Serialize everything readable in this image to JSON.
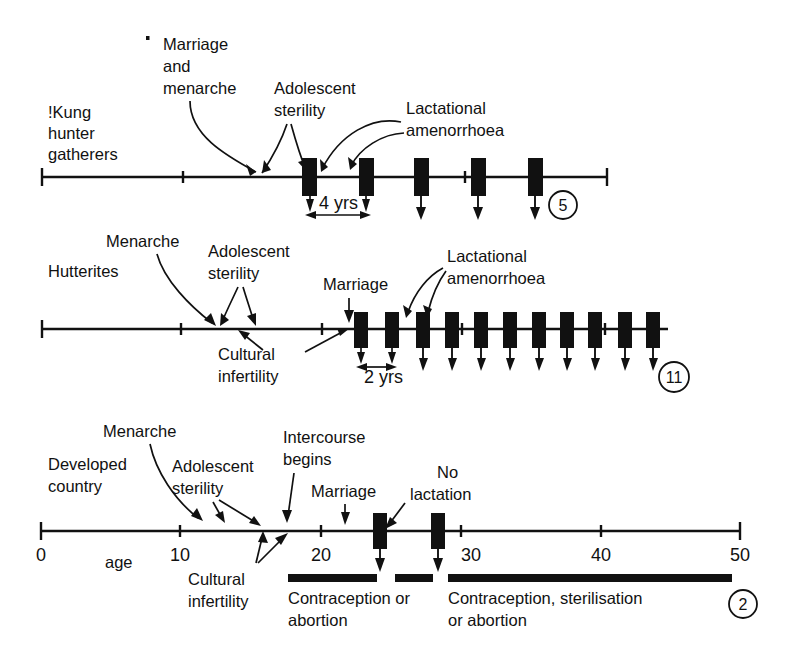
{
  "figure": {
    "axis_label": "age",
    "axis_ticks": [
      "0",
      "10",
      "20",
      "30",
      "40",
      "50"
    ],
    "axis_tick_values": [
      0,
      10,
      20,
      30,
      40,
      50
    ]
  },
  "rows": [
    {
      "id": "kung",
      "name_line1": "!Kung",
      "name_line2": "hunter",
      "name_line3": "gatherers",
      "births_badge": "5",
      "interval_label": "4 yrs",
      "annotations": [
        {
          "id": "marriage-menarche",
          "line1": "Marriage",
          "line2": "and",
          "line3": "menarche"
        },
        {
          "id": "adolescent-sterility",
          "line1": "Adolescent",
          "line2": "sterility"
        },
        {
          "id": "lactational-amenorrhoea",
          "line1": "Lactational",
          "line2": "amenorrhoea"
        }
      ],
      "birth_ages": [
        19.0,
        23.0,
        27.0,
        31.0,
        35.5
      ],
      "axis_from": 0,
      "axis_to": 40.5,
      "ticks": [
        10,
        30
      ]
    },
    {
      "id": "hutterites",
      "name_line1": "Hutterites",
      "births_badge": "11",
      "interval_label": "2 yrs",
      "annotations": [
        {
          "id": "menarche",
          "line1": "Menarche"
        },
        {
          "id": "adolescent-sterility",
          "line1": "Adolescent",
          "line2": "sterility"
        },
        {
          "id": "cultural-infertility",
          "line1": "Cultural",
          "line2": "infertility"
        },
        {
          "id": "marriage",
          "line1": "Marriage"
        },
        {
          "id": "lactational-amenorrhoea",
          "line1": "Lactational",
          "line2": "amenorrhoea"
        }
      ],
      "birth_ages": [
        22.8,
        25.0,
        27.2,
        29.2,
        31.3,
        33.4,
        35.4,
        37.4,
        39.4,
        41.6,
        43.6
      ],
      "axis_from": 0,
      "axis_to": 45.0,
      "ticks": [
        10,
        20,
        30,
        40
      ]
    },
    {
      "id": "developed",
      "name_line1": "Developed",
      "name_line2": "country",
      "births_badge": "2",
      "annotations": [
        {
          "id": "menarche",
          "line1": "Menarche"
        },
        {
          "id": "adolescent-sterility",
          "line1": "Adolescent",
          "line2": "sterility"
        },
        {
          "id": "cultural-infertility",
          "line1": "Cultural",
          "line2": "infertility"
        },
        {
          "id": "intercourse-begins",
          "line1": "Intercourse",
          "line2": "begins"
        },
        {
          "id": "marriage",
          "line1": "Marriage"
        },
        {
          "id": "no-lactation",
          "line1": "No",
          "line2": "lactation"
        }
      ],
      "birth_ages": [
        24.2,
        28.4
      ],
      "axis_from": 0,
      "axis_to": 50,
      "ticks": [
        10,
        20,
        25,
        30,
        40,
        50
      ],
      "control_bands": [
        {
          "id": "contraception-or-abortion",
          "line1": "Contraception or",
          "line2": "abortion"
        },
        {
          "id": "contraception-sterilisation-or-abortion",
          "line1": "Contraception, sterilisation",
          "line2": "or abortion"
        }
      ]
    }
  ]
}
